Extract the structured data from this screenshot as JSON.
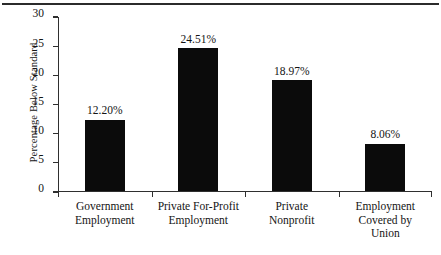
{
  "chart_data": {
    "type": "bar",
    "title": "",
    "xlabel": "",
    "ylabel": "Percentage Below Standard",
    "ylim": [
      0,
      30
    ],
    "yticks": [
      0,
      5,
      10,
      15,
      20,
      25,
      30
    ],
    "ytick_labels": [
      "0",
      "5",
      "10",
      "15",
      "20",
      "25",
      "30"
    ],
    "grid": false,
    "legend": "none",
    "bar_color": "#0b0b0b",
    "categories": [
      "Government Employment",
      "Private For-Profit Employment",
      "Private Nonprofit",
      "Employment Covered by Union"
    ],
    "category_lines": [
      [
        "Government",
        "Employment"
      ],
      [
        "Private For-Profit",
        "Employment"
      ],
      [
        "Private",
        "Nonprofit"
      ],
      [
        "Employment",
        "Covered by",
        "Union"
      ]
    ],
    "values": [
      12.2,
      24.51,
      18.97,
      8.06
    ],
    "data_labels": [
      "12.20%",
      "24.51%",
      "18.97%",
      "8.06%"
    ]
  }
}
